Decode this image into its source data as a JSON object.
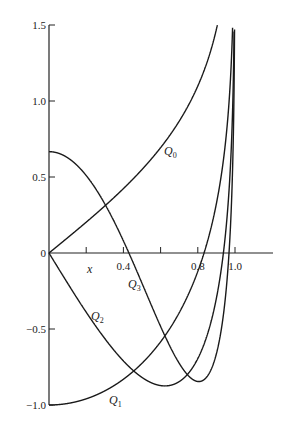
{
  "chart_data": {
    "type": "line",
    "title": "",
    "xlabel": "x",
    "ylabel": "",
    "xlim": [
      0,
      1.15
    ],
    "ylim": [
      -1.0,
      1.5
    ],
    "grid": false,
    "legend": "inline labels",
    "x_ticks": [
      0.2,
      0.4,
      0.6,
      0.8,
      1.0
    ],
    "x_tick_labels": [
      "",
      "0.4",
      "",
      "0.8",
      "1.0"
    ],
    "y_ticks": [
      1.5,
      1.0,
      0.5,
      0,
      -0.5,
      -1.0
    ],
    "y_tick_labels": [
      "1.5",
      "1.0",
      "0.5",
      "0",
      "−0.5",
      "−1.0"
    ],
    "x": [
      0,
      0.1,
      0.2,
      0.3,
      0.4,
      0.5,
      0.6,
      0.7,
      0.8,
      0.9,
      0.95,
      0.98
    ],
    "series": [
      {
        "name": "Q0",
        "values": [
          0,
          0.1,
          0.203,
          0.31,
          0.424,
          0.549,
          0.693,
          0.867,
          1.099,
          1.472,
          1.832,
          2.298
        ]
      },
      {
        "name": "Q1",
        "values": [
          -1.0,
          -0.99,
          -0.959,
          -0.907,
          -0.83,
          -0.725,
          -0.584,
          -0.393,
          -0.121,
          0.325,
          0.74,
          1.252
        ]
      },
      {
        "name": "Q2",
        "values": [
          0,
          -0.148,
          -0.285,
          -0.402,
          -0.489,
          -0.532,
          -0.515,
          -0.414,
          -0.195,
          0.245,
          0.685,
          1.254
        ]
      },
      {
        "name": "Q3",
        "values": [
          0.667,
          0.588,
          0.363,
          0.028,
          -0.341,
          -0.649,
          -0.818,
          -0.774,
          -0.475,
          0.14,
          0.72,
          1.4
        ]
      }
    ],
    "annotations": [
      {
        "text": "Q0",
        "subscript": "0",
        "near": [
          0.58,
          0.72
        ]
      },
      {
        "text": "Q1",
        "subscript": "1",
        "near": [
          0.45,
          -0.99
        ]
      },
      {
        "text": "Q2",
        "subscript": "2",
        "near": [
          0.33,
          -0.45
        ]
      },
      {
        "text": "Q3",
        "subscript": "3",
        "near": [
          0.43,
          -0.2
        ]
      }
    ]
  },
  "labels": {
    "x_axis": "x",
    "q0": "Q",
    "q0_sub": "0",
    "q1": "Q",
    "q1_sub": "1",
    "q2": "Q",
    "q2_sub": "2",
    "q3": "Q",
    "q3_sub": "3"
  }
}
